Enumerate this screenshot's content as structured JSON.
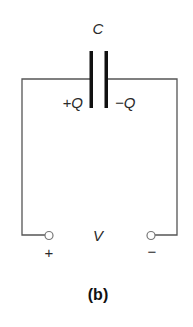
{
  "diagram": {
    "type": "circuit",
    "components": {
      "capacitor": {
        "label": "C",
        "left_plate_charge": "+Q",
        "right_plate_charge": "−Q"
      },
      "voltage": {
        "label": "V",
        "positive_terminal": "+",
        "negative_terminal": "−"
      }
    },
    "caption": "(b)",
    "colors": {
      "wire": "#555555",
      "plate": "#111111",
      "terminal": "#777777",
      "text": "#2a2a2a"
    }
  }
}
